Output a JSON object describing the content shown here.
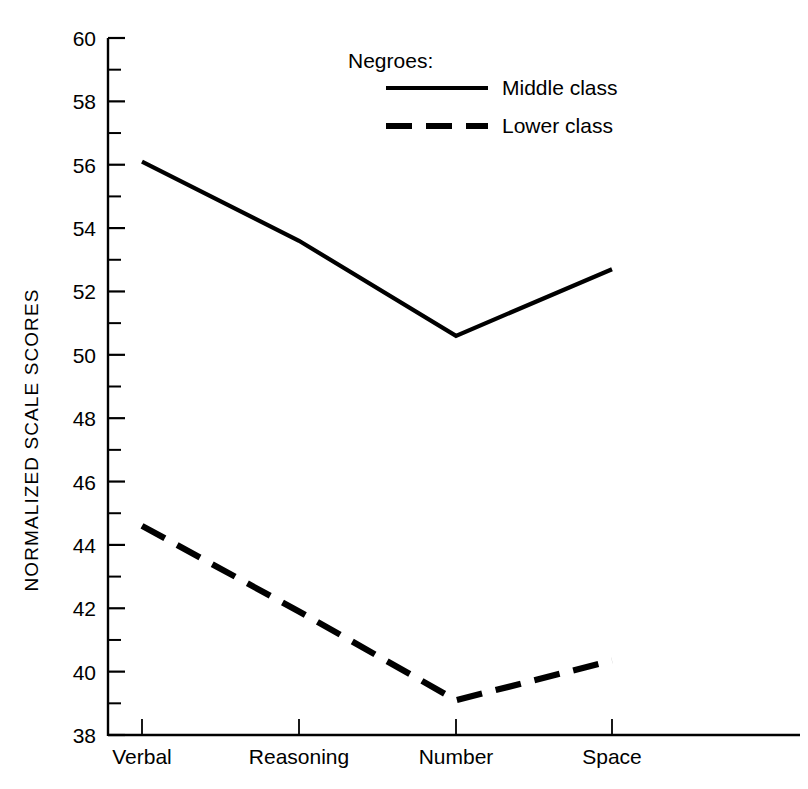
{
  "chart_data": {
    "type": "line",
    "title": "",
    "xlabel": "",
    "ylabel": "NORMALIZED SCALE SCORES",
    "categories": [
      "Verbal",
      "Reasoning",
      "Number",
      "Space"
    ],
    "ylim": [
      38,
      60
    ],
    "ytick_step": 2,
    "yminor_step": 1,
    "grid": false,
    "legend_position": "top-center",
    "legend_title": "Negroes:",
    "ytick_labels": [
      "38",
      "40",
      "42",
      "44",
      "46",
      "48",
      "50",
      "52",
      "54",
      "56",
      "58",
      "60"
    ],
    "ytick_values": [
      38,
      40,
      42,
      44,
      46,
      48,
      50,
      52,
      54,
      56,
      58,
      60
    ],
    "series": [
      {
        "name": "Middle class",
        "style": "solid",
        "color": "#000000",
        "values": [
          56.1,
          53.6,
          50.6,
          52.7
        ]
      },
      {
        "name": "Lower class",
        "style": "dashed",
        "color": "#000000",
        "values": [
          44.6,
          41.9,
          39.1,
          40.35
        ]
      }
    ]
  },
  "figure": {
    "background": "#ffffff",
    "ink_color": "#000000"
  }
}
